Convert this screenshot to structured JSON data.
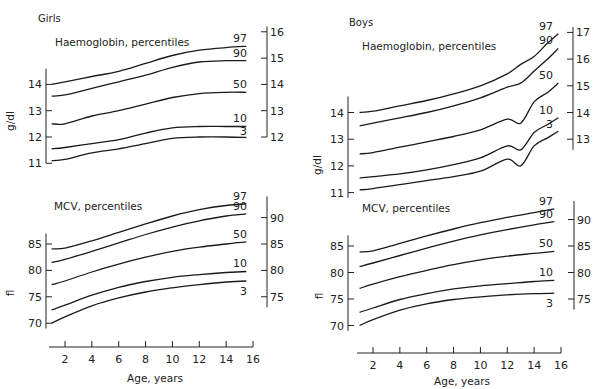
{
  "chart_data": [
    {
      "id": "girls-hb",
      "type": "line",
      "panel": "Girls",
      "title": "Haemoglobin, percentiles",
      "ylabel": "g/dl",
      "xlabel": "",
      "ylim": [
        11,
        16
      ],
      "left_ticks": [
        11,
        12,
        13,
        14
      ],
      "right_ticks": [
        12,
        13,
        14,
        15,
        16
      ],
      "x": [
        1,
        2,
        4,
        6,
        8,
        10,
        12,
        14,
        15.5
      ],
      "series": [
        {
          "name": "97",
          "values": [
            14.0,
            14.1,
            14.3,
            14.5,
            14.8,
            15.1,
            15.3,
            15.4,
            15.45
          ]
        },
        {
          "name": "90",
          "values": [
            13.55,
            13.6,
            13.85,
            14.1,
            14.35,
            14.65,
            14.85,
            14.9,
            14.9
          ]
        },
        {
          "name": "50",
          "values": [
            12.5,
            12.5,
            12.8,
            13.0,
            13.25,
            13.5,
            13.65,
            13.7,
            13.7
          ]
        },
        {
          "name": "10",
          "values": [
            11.55,
            11.6,
            11.75,
            11.9,
            12.15,
            12.35,
            12.4,
            12.4,
            12.4
          ]
        },
        {
          "name": "3",
          "values": [
            11.1,
            11.15,
            11.4,
            11.55,
            11.75,
            11.95,
            12.0,
            12.0,
            11.98
          ]
        }
      ]
    },
    {
      "id": "girls-mcv",
      "type": "line",
      "panel": "Girls",
      "title": "MCV, percentiles",
      "ylabel": "fl",
      "xlabel": "Age, years",
      "ylim": [
        70,
        92
      ],
      "xlim": [
        1,
        16
      ],
      "x_ticks": [
        2,
        4,
        6,
        8,
        10,
        12,
        14,
        16
      ],
      "left_ticks": [
        70,
        75,
        80,
        85
      ],
      "right_ticks": [
        75,
        80,
        85,
        90
      ],
      "x": [
        1,
        2,
        4,
        6,
        8,
        10,
        12,
        14,
        15.5
      ],
      "series": [
        {
          "name": "97",
          "values": [
            84.1,
            84.2,
            85.6,
            87.2,
            88.8,
            90.3,
            91.5,
            92.3,
            92.6
          ]
        },
        {
          "name": "90",
          "values": [
            81.5,
            82.1,
            83.6,
            85.2,
            86.8,
            88.2,
            89.4,
            90.3,
            90.7
          ]
        },
        {
          "name": "50",
          "values": [
            77.3,
            78.0,
            79.7,
            81.2,
            82.5,
            83.6,
            84.4,
            85.0,
            85.4
          ]
        },
        {
          "name": "10",
          "values": [
            72.5,
            73.4,
            75.3,
            76.8,
            77.9,
            78.7,
            79.2,
            79.6,
            79.8
          ]
        },
        {
          "name": "3",
          "values": [
            70.0,
            71.2,
            73.3,
            74.8,
            75.9,
            76.7,
            77.3,
            77.8,
            78.0
          ]
        }
      ]
    },
    {
      "id": "boys-hb",
      "type": "line",
      "panel": "Boys",
      "title": "Haemoglobin, percentiles",
      "ylabel": "g/dl",
      "xlabel": "",
      "ylim": [
        11,
        17
      ],
      "left_ticks": [
        11,
        12,
        13,
        14
      ],
      "right_ticks": [
        13,
        14,
        15,
        16,
        17
      ],
      "x": [
        1,
        2,
        4,
        6,
        8,
        10,
        12,
        13,
        14,
        15,
        15.8
      ],
      "series": [
        {
          "name": "97",
          "values": [
            14.0,
            14.05,
            14.25,
            14.45,
            14.7,
            15.0,
            15.45,
            15.8,
            16.1,
            16.6,
            16.95
          ]
        },
        {
          "name": "90",
          "values": [
            13.5,
            13.6,
            13.8,
            14.0,
            14.25,
            14.55,
            14.95,
            15.1,
            15.55,
            16.0,
            16.4
          ]
        },
        {
          "name": "50",
          "values": [
            12.45,
            12.5,
            12.7,
            12.9,
            13.1,
            13.35,
            13.75,
            13.6,
            14.4,
            14.75,
            15.1
          ]
        },
        {
          "name": "10",
          "values": [
            11.55,
            11.6,
            11.7,
            11.85,
            12.05,
            12.3,
            12.75,
            12.6,
            13.25,
            13.55,
            13.8
          ]
        },
        {
          "name": "3",
          "values": [
            11.1,
            11.15,
            11.3,
            11.45,
            11.6,
            11.8,
            12.25,
            12.0,
            12.75,
            13.05,
            13.3
          ]
        }
      ]
    },
    {
      "id": "boys-mcv",
      "type": "line",
      "panel": "Boys",
      "title": "MCV, percentiles",
      "ylabel": "fl",
      "xlabel": "Age, years",
      "ylim": [
        70,
        92
      ],
      "xlim": [
        1,
        16
      ],
      "x_ticks": [
        2,
        4,
        6,
        8,
        10,
        12,
        14,
        16
      ],
      "left_ticks": [
        70,
        75,
        80,
        85
      ],
      "right_ticks": [
        75,
        80,
        85,
        90
      ],
      "x": [
        1,
        2,
        4,
        6,
        8,
        10,
        12,
        14,
        15.5
      ],
      "series": [
        {
          "name": "97",
          "values": [
            83.9,
            84.1,
            85.5,
            86.9,
            88.2,
            89.4,
            90.4,
            91.3,
            92.0
          ]
        },
        {
          "name": "90",
          "values": [
            81.1,
            81.8,
            83.2,
            84.6,
            85.9,
            87.1,
            88.1,
            89.0,
            89.6
          ]
        },
        {
          "name": "50",
          "values": [
            77.0,
            77.8,
            79.2,
            80.4,
            81.5,
            82.4,
            83.1,
            83.6,
            84.0
          ]
        },
        {
          "name": "10",
          "values": [
            72.5,
            73.3,
            74.9,
            76.0,
            76.9,
            77.5,
            77.9,
            78.3,
            78.5
          ]
        },
        {
          "name": "3",
          "values": [
            70.0,
            71.1,
            72.9,
            74.1,
            74.9,
            75.4,
            75.8,
            76.0,
            76.1
          ]
        }
      ]
    }
  ]
}
